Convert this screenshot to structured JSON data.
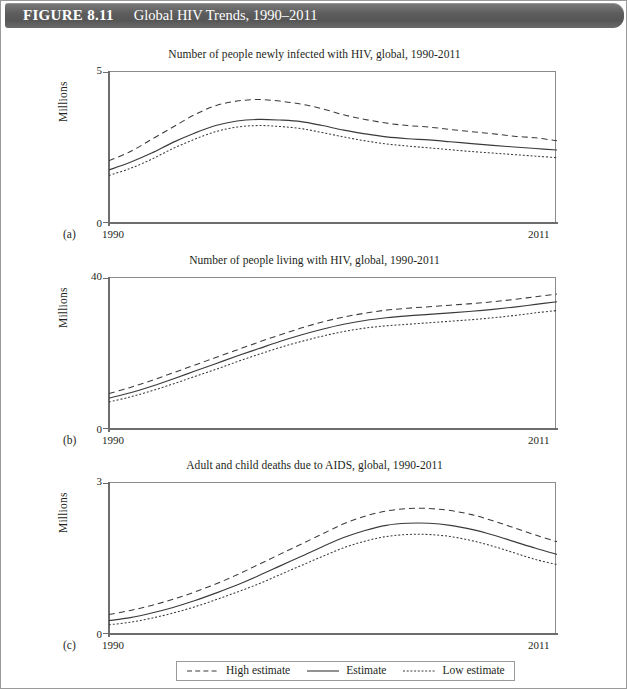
{
  "banner": {
    "figure_number": "FIGURE 8.11",
    "title": "Global HIV Trends, 1990–2011",
    "background_color": "#5d5d5d",
    "text_color": "#ffffff"
  },
  "legend": {
    "items": [
      {
        "label": "High estimate",
        "style": "dashed"
      },
      {
        "label": "Estimate",
        "style": "solid"
      },
      {
        "label": "Low estimate",
        "style": "dotted"
      }
    ]
  },
  "panels": {
    "a": {
      "letter": "(a)",
      "title": "Number of people newly infected with HIV, global, 1990-2011",
      "ylabel": "Millions",
      "y_max_label": "5",
      "y_min_label": "0",
      "x_start_label": "1990",
      "x_end_label": "2011"
    },
    "b": {
      "letter": "(b)",
      "title": "Number of people living with HIV, global, 1990-2011",
      "ylabel": "Millions",
      "y_max_label": "40",
      "y_min_label": "0",
      "x_start_label": "1990",
      "x_end_label": "2011"
    },
    "c": {
      "letter": "(c)",
      "title": "Adult and child deaths due to AIDS, global, 1990-2011",
      "ylabel": "Millions",
      "y_max_label": "3",
      "y_min_label": "0",
      "x_start_label": "1990",
      "x_end_label": "2011"
    }
  },
  "chart_data": [
    {
      "id": "a",
      "type": "line",
      "title": "Number of people newly infected with HIV, global, 1990-2011",
      "xlabel": "",
      "ylabel": "Millions",
      "xlim": [
        1990,
        2011
      ],
      "ylim": [
        0,
        5
      ],
      "grid": false,
      "legend_position": "bottom",
      "x": [
        1990,
        1991,
        1992,
        1993,
        1994,
        1995,
        1996,
        1997,
        1998,
        1999,
        2000,
        2001,
        2002,
        2003,
        2004,
        2005,
        2006,
        2007,
        2008,
        2009,
        2010,
        2011
      ],
      "series": [
        {
          "name": "High estimate",
          "style": "dashed",
          "values": [
            2.1,
            2.4,
            2.8,
            3.2,
            3.6,
            3.9,
            4.05,
            4.1,
            4.05,
            3.95,
            3.8,
            3.6,
            3.45,
            3.33,
            3.25,
            3.2,
            3.12,
            3.05,
            2.98,
            2.9,
            2.85,
            2.75
          ]
        },
        {
          "name": "Estimate",
          "style": "solid",
          "values": [
            1.8,
            2.05,
            2.35,
            2.7,
            3.0,
            3.25,
            3.4,
            3.45,
            3.43,
            3.38,
            3.25,
            3.1,
            2.98,
            2.88,
            2.82,
            2.78,
            2.72,
            2.66,
            2.6,
            2.55,
            2.5,
            2.45
          ]
        },
        {
          "name": "Low estimate",
          "style": "dotted",
          "values": [
            1.62,
            1.85,
            2.15,
            2.5,
            2.8,
            3.05,
            3.2,
            3.25,
            3.22,
            3.15,
            3.02,
            2.88,
            2.75,
            2.65,
            2.58,
            2.52,
            2.46,
            2.4,
            2.35,
            2.3,
            2.25,
            2.2
          ]
        }
      ]
    },
    {
      "id": "b",
      "type": "line",
      "title": "Number of people living with HIV, global, 1990-2011",
      "xlabel": "",
      "ylabel": "Millions",
      "xlim": [
        1990,
        2011
      ],
      "ylim": [
        0,
        40
      ],
      "grid": false,
      "legend_position": "bottom",
      "x": [
        1990,
        1991,
        1992,
        1993,
        1994,
        1995,
        1996,
        1997,
        1998,
        1999,
        2000,
        2001,
        2002,
        2003,
        2004,
        2005,
        2006,
        2007,
        2008,
        2009,
        2010,
        2011
      ],
      "series": [
        {
          "name": "High estimate",
          "style": "dashed",
          "values": [
            9.8,
            11.4,
            13.2,
            15.2,
            17.2,
            19.2,
            21.2,
            23.2,
            25.1,
            26.9,
            28.5,
            29.8,
            30.8,
            31.6,
            32.1,
            32.5,
            32.9,
            33.3,
            33.8,
            34.4,
            35.1,
            35.8
          ]
        },
        {
          "name": "Estimate",
          "style": "solid",
          "values": [
            8.6,
            10.0,
            11.7,
            13.6,
            15.6,
            17.6,
            19.6,
            21.5,
            23.4,
            25.1,
            26.6,
            27.9,
            28.9,
            29.6,
            30.1,
            30.5,
            30.9,
            31.3,
            31.8,
            32.4,
            33.1,
            33.8
          ]
        },
        {
          "name": "Low estimate",
          "style": "dotted",
          "values": [
            7.6,
            8.9,
            10.5,
            12.3,
            14.2,
            16.1,
            18.1,
            20.0,
            21.8,
            23.4,
            24.8,
            26.0,
            26.9,
            27.5,
            27.9,
            28.3,
            28.7,
            29.1,
            29.6,
            30.2,
            30.9,
            31.5
          ]
        }
      ]
    },
    {
      "id": "c",
      "type": "line",
      "title": "Adult and child deaths due to AIDS, global, 1990-2011",
      "xlabel": "",
      "ylabel": "Millions",
      "xlim": [
        1990,
        2011
      ],
      "ylim": [
        0,
        3
      ],
      "grid": false,
      "legend_position": "bottom",
      "x": [
        1990,
        1991,
        1992,
        1993,
        1994,
        1995,
        1996,
        1997,
        1998,
        1999,
        2000,
        2001,
        2002,
        2003,
        2004,
        2005,
        2006,
        2007,
        2008,
        2009,
        2010,
        2011
      ],
      "series": [
        {
          "name": "High estimate",
          "style": "dashed",
          "values": [
            0.42,
            0.5,
            0.6,
            0.72,
            0.86,
            1.02,
            1.2,
            1.4,
            1.6,
            1.8,
            2.0,
            2.2,
            2.35,
            2.45,
            2.5,
            2.5,
            2.46,
            2.38,
            2.26,
            2.12,
            1.98,
            1.85
          ]
        },
        {
          "name": "Estimate",
          "style": "solid",
          "values": [
            0.3,
            0.36,
            0.45,
            0.56,
            0.69,
            0.84,
            1.0,
            1.18,
            1.37,
            1.56,
            1.75,
            1.93,
            2.07,
            2.17,
            2.21,
            2.21,
            2.17,
            2.09,
            1.98,
            1.85,
            1.72,
            1.6
          ]
        },
        {
          "name": "Low estimate",
          "style": "dotted",
          "values": [
            0.22,
            0.27,
            0.35,
            0.45,
            0.57,
            0.71,
            0.86,
            1.02,
            1.2,
            1.38,
            1.56,
            1.73,
            1.86,
            1.95,
            1.99,
            1.99,
            1.95,
            1.87,
            1.76,
            1.63,
            1.5,
            1.4
          ]
        }
      ]
    }
  ]
}
